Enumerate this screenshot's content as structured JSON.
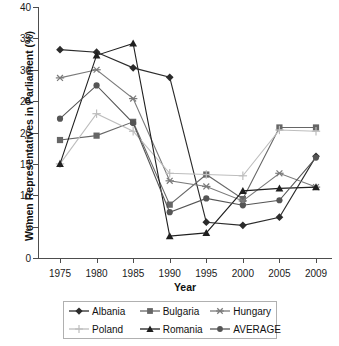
{
  "chart_data": {
    "type": "line",
    "title": "",
    "xlabel": "Year",
    "ylabel": "Women Representatives in Parliament (%)",
    "categories": [
      "1975",
      "1980",
      "1985",
      "1990",
      "1995",
      "2000",
      "2005",
      "2009"
    ],
    "xlim": [
      1975,
      2009
    ],
    "ylim": [
      0,
      40
    ],
    "yticks": [
      "0",
      "5",
      "10",
      "15",
      "20",
      "25",
      "30",
      "35",
      "40"
    ],
    "grid": false,
    "legend_position": "bottom",
    "series": [
      {
        "name": "Albania",
        "marker": "diamond",
        "color": "#2b2b2b",
        "values": [
          33.2,
          32.8,
          30.3,
          28.8,
          5.7,
          5.2,
          6.5,
          16.2
        ]
      },
      {
        "name": "Bulgaria",
        "marker": "square",
        "color": "#666666",
        "values": [
          18.8,
          19.5,
          21.7,
          8.5,
          13.3,
          9.4,
          20.8,
          20.8
        ]
      },
      {
        "name": "Hungary",
        "marker": "star",
        "color": "#7a7a7a",
        "values": [
          28.7,
          30.0,
          25.4,
          12.3,
          11.4,
          9.1,
          13.5,
          11.3
        ]
      },
      {
        "name": "Poland",
        "marker": "plus",
        "color": "#bdbdbd",
        "values": [
          15.0,
          23.0,
          20.2,
          13.5,
          13.3,
          13.1,
          20.4,
          20.2
        ]
      },
      {
        "name": "Romania",
        "marker": "triangle",
        "color": "#1f1f1f",
        "values": [
          15.0,
          32.3,
          34.2,
          3.5,
          4.0,
          10.7,
          11.1,
          11.3
        ]
      },
      {
        "name": "AVERAGE",
        "marker": "circle",
        "color": "#555555",
        "values": [
          22.2,
          27.5,
          21.5,
          7.3,
          9.5,
          8.4,
          9.2,
          16.0
        ]
      }
    ]
  }
}
